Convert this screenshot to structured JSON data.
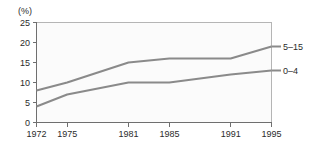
{
  "chart_data": {
    "type": "line",
    "title": "",
    "subtitle": "",
    "xlabel": "",
    "ylabel": "",
    "unit_label": "(%)",
    "x": [
      1972,
      1975,
      1981,
      1985,
      1991,
      1995
    ],
    "categories": [
      "1972",
      "1975",
      "1981",
      "1985",
      "1991",
      "1995"
    ],
    "xlim": [
      1972,
      1995
    ],
    "ylim": [
      0,
      25
    ],
    "yticks": [
      0,
      5,
      10,
      15,
      20,
      25
    ],
    "ytick_labels": [
      "0",
      "5",
      "10",
      "15",
      "20",
      "25"
    ],
    "xticks": [
      1972,
      1975,
      1981,
      1985,
      1991,
      1995
    ],
    "xtick_labels": [
      "1972",
      "1975",
      "1981",
      "1985",
      "1991",
      "1995"
    ],
    "grid": false,
    "legend": "inline-right-end-labels",
    "series": [
      {
        "name": "5–15",
        "label": "5–15",
        "color": "#8a8a8a",
        "values": [
          8,
          10,
          15,
          16,
          16,
          19
        ]
      },
      {
        "name": "0–4",
        "label": "0–4",
        "color": "#8a8a8a",
        "values": [
          4,
          7,
          10,
          10,
          12,
          13
        ]
      }
    ],
    "colors": {
      "line": "#8a8a8a",
      "axis": "#6f6f6f",
      "frame": "#b5b5b5",
      "text": "#2b2b2b",
      "plot_background": "#fbfbfb",
      "page_background": "#ffffff"
    }
  }
}
